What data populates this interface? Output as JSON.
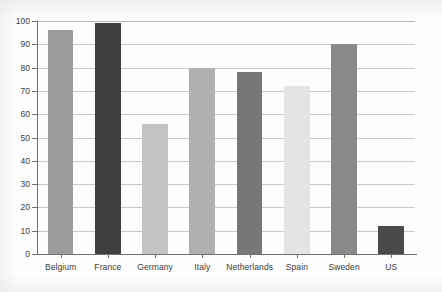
{
  "chart_data": {
    "type": "bar",
    "title": "",
    "subtitle": "",
    "xlabel": "",
    "ylabel": "",
    "categories": [
      "Belgium",
      "France",
      "Germany",
      "Italy",
      "Netherlands",
      "Spain",
      "Sweden",
      "US"
    ],
    "values": [
      96,
      99,
      56,
      80,
      78,
      72,
      90,
      12
    ],
    "bar_colors": [
      "#9b9b9b",
      "#3f3f3f",
      "#c3c3c3",
      "#b0b0b0",
      "#777777",
      "#e4e4e4",
      "#8a8a8a",
      "#4a4a4a"
    ],
    "ylim": [
      0,
      100
    ],
    "ytick_values": [
      0,
      10,
      20,
      30,
      40,
      50,
      60,
      70,
      80,
      90,
      100
    ],
    "ytick_labels": [
      "0",
      "10",
      "20",
      "30",
      "40",
      "50",
      "60",
      "70",
      "80",
      "90",
      "100"
    ],
    "grid": true,
    "grid_axis": "y",
    "legend": false,
    "legend_position": "none",
    "grid_color": "#c9c9c9",
    "axis_color": "#6f6f6f",
    "background_color": "#fdfdfd",
    "text_color": "#3c3c3c",
    "annotations": []
  }
}
